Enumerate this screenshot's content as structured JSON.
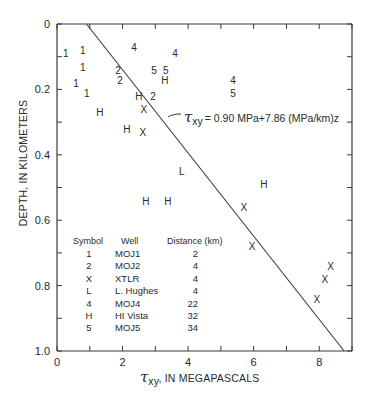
{
  "chart_data": {
    "type": "scatter",
    "title": "",
    "xlabel": "τxy, IN MEGAPASCALS",
    "xlabel_parts": {
      "symbol": "τ",
      "subscript": "xy",
      "rest": ", IN MEGAPASCALS"
    },
    "ylabel": "DEPTH, IN KILOMETERS",
    "xlim": [
      0,
      9
    ],
    "ylim": [
      0,
      1.0
    ],
    "y_inverted": true,
    "x_axis_position": "bottom",
    "x_ticks": [
      0,
      1,
      2,
      3,
      4,
      5,
      6,
      7,
      8,
      9
    ],
    "x_tick_labels": [
      {
        "value": 0,
        "label": "0"
      },
      {
        "value": 2,
        "label": "2"
      },
      {
        "value": 4,
        "label": "4"
      },
      {
        "value": 6,
        "label": "6"
      },
      {
        "value": 8,
        "label": "8"
      }
    ],
    "y_ticks": [
      0,
      0.1,
      0.2,
      0.3,
      0.4,
      0.5,
      0.6,
      0.7,
      0.8,
      0.9,
      1.0
    ],
    "y_tick_labels": [
      {
        "value": 0,
        "label": "0"
      },
      {
        "value": 0.2,
        "label": "0.2"
      },
      {
        "value": 0.4,
        "label": "0.4"
      },
      {
        "value": 0.6,
        "label": "0.6"
      },
      {
        "value": 0.8,
        "label": "0.8"
      },
      {
        "value": 1.0,
        "label": "1.0"
      }
    ],
    "grid": false,
    "series": [
      {
        "name": "MOJ1",
        "symbol": "1",
        "distance_km": 2,
        "points": [
          [
            0.27,
            0.09
          ],
          [
            0.79,
            0.08
          ],
          [
            0.79,
            0.13
          ],
          [
            0.58,
            0.18
          ],
          [
            0.91,
            0.21
          ]
        ]
      },
      {
        "name": "MOJ2",
        "symbol": "2",
        "distance_km": 4,
        "points": [
          [
            1.86,
            0.14
          ],
          [
            1.92,
            0.17
          ],
          [
            2.93,
            0.22
          ]
        ]
      },
      {
        "name": "XTLR",
        "symbol": "X",
        "distance_km": 4,
        "points": [
          [
            2.65,
            0.26
          ],
          [
            2.62,
            0.33
          ],
          [
            5.7,
            0.56
          ],
          [
            5.95,
            0.68
          ],
          [
            8.35,
            0.74
          ],
          [
            8.17,
            0.78
          ],
          [
            7.93,
            0.84
          ]
        ]
      },
      {
        "name": "L. Hughes",
        "symbol": "L",
        "distance_km": 4,
        "points": [
          [
            3.81,
            0.45
          ]
        ]
      },
      {
        "name": "MOJ4",
        "symbol": "4",
        "distance_km": 22,
        "points": [
          [
            2.35,
            0.07
          ],
          [
            3.6,
            0.09
          ],
          [
            5.37,
            0.17
          ]
        ]
      },
      {
        "name": "HI Vista",
        "symbol": "H",
        "distance_km": 32,
        "points": [
          [
            3.29,
            0.17
          ],
          [
            2.5,
            0.22
          ],
          [
            1.31,
            0.27
          ],
          [
            2.13,
            0.32
          ],
          [
            2.71,
            0.54
          ],
          [
            3.38,
            0.54
          ],
          [
            6.31,
            0.49
          ]
        ]
      },
      {
        "name": "MOJ5",
        "symbol": "5",
        "distance_km": 34,
        "points": [
          [
            2.96,
            0.14
          ],
          [
            3.32,
            0.14
          ],
          [
            5.37,
            0.21
          ]
        ]
      }
    ],
    "fit_line": {
      "equation": "τxy = 0.90 MPa + 7.86 (MPa/km) z",
      "intercept_mpa": 0.9,
      "slope_mpa_per_km": 7.86,
      "from": [
        0.9,
        0.0
      ],
      "to": [
        8.76,
        1.0
      ]
    },
    "annotation": {
      "symbol": "τ",
      "subscript": "xy",
      "text": "= 0.90 MPa+7.86 (MPa/km)z"
    },
    "legend": {
      "position": "inside lower-left",
      "headers": [
        "Symbol",
        "Well",
        "Distance (km)"
      ],
      "rows": [
        {
          "symbol": "1",
          "well": "MOJ1",
          "distance": "2"
        },
        {
          "symbol": "2",
          "well": "MOJ2",
          "distance": "4"
        },
        {
          "symbol": "X",
          "well": "XTLR",
          "distance": "4"
        },
        {
          "symbol": "L",
          "well": "L. Hughes",
          "distance": "4"
        },
        {
          "symbol": "4",
          "well": "MOJ4",
          "distance": "22"
        },
        {
          "symbol": "H",
          "well": "HI Vista",
          "distance": "32"
        },
        {
          "symbol": "5",
          "well": "MOJ5",
          "distance": "34"
        }
      ]
    }
  },
  "colors": {
    "ink": "#2a2a2a",
    "background": "#ffffff"
  }
}
